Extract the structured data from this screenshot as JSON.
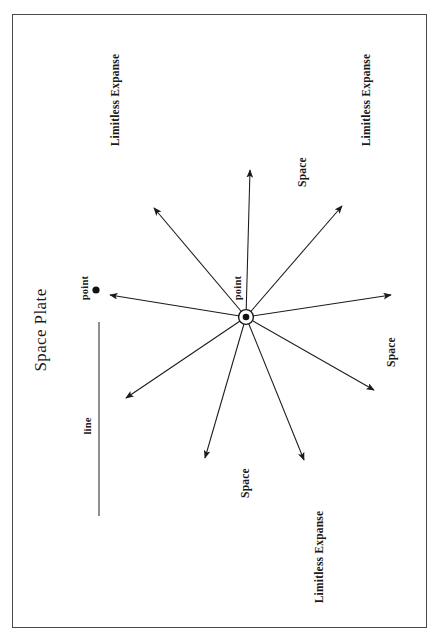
{
  "figure": {
    "title": "Space Plate",
    "frame": {
      "x": 12,
      "y": 14,
      "width": 415,
      "height": 614,
      "stroke": "#4a4a4a"
    },
    "orientation": "landscape-rotated-90ccw",
    "stroke_color": "#1a1a1a",
    "background": "#ffffff"
  },
  "center_point": {
    "label": "point",
    "x": 246,
    "y": 317,
    "outer_radius": 7.5,
    "inner_radius": 3.2
  },
  "free_point": {
    "label": "point",
    "x": 96,
    "y": 290,
    "radius": 3.4
  },
  "line_segment": {
    "label": "line",
    "x": 99,
    "y1": 322,
    "y2": 516
  },
  "rays": [
    {
      "name": "ray-up",
      "angle_deg": 91,
      "tip_x": 250,
      "tip_y": 168
    },
    {
      "name": "ray-upper-right",
      "angle_deg": 47,
      "tip_x": 344,
      "tip_y": 204
    },
    {
      "name": "ray-right",
      "angle_deg": 8,
      "tip_x": 394,
      "tip_y": 294
    },
    {
      "name": "ray-lower-right",
      "angle_deg": -34,
      "tip_x": 376,
      "tip_y": 392
    },
    {
      "name": "ray-down-right",
      "angle_deg": -64,
      "tip_x": 305,
      "tip_y": 463
    },
    {
      "name": "ray-down-left",
      "angle_deg": -108,
      "tip_x": 204,
      "tip_y": 461
    },
    {
      "name": "ray-lower-left",
      "angle_deg": -148,
      "tip_x": 124,
      "tip_y": 400
    },
    {
      "name": "ray-left",
      "angle_deg": 170,
      "tip_x": 108,
      "tip_y": 295
    },
    {
      "name": "ray-upper-left",
      "angle_deg": 132,
      "tip_x": 152,
      "tip_y": 206
    }
  ],
  "labels": {
    "expanse": "Limitless Expanse",
    "space": "Space",
    "point": "point",
    "line": "line"
  },
  "annotations": [
    {
      "name": "expanse-top-left",
      "text": "Limitless Expanse",
      "x": 116,
      "y": 100
    },
    {
      "name": "expanse-top-right",
      "text": "Limitless Expanse",
      "x": 367,
      "y": 100
    },
    {
      "name": "expanse-bottom",
      "text": "Limitless Expanse",
      "x": 320,
      "y": 557
    },
    {
      "name": "space-upper-right",
      "text": "Space",
      "x": 303,
      "y": 172
    },
    {
      "name": "space-right",
      "text": "Space",
      "x": 392,
      "y": 352
    },
    {
      "name": "space-bottom",
      "text": "Space",
      "x": 246,
      "y": 483
    }
  ]
}
